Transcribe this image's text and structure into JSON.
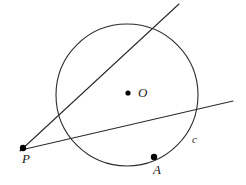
{
  "figure": {
    "background_color": "#ffffff",
    "stroke_color": "#2b2b2b",
    "point_color": "#000000",
    "stroke_width": 1.1,
    "width": 246,
    "height": 185
  },
  "labels": {
    "point_p": "P",
    "point_a": "A",
    "center_o": "O",
    "circle_c": "c"
  },
  "geometry": {
    "circle": {
      "cx": 127,
      "cy": 95,
      "r": 71
    },
    "center_dot": {
      "cx": 128,
      "cy": 93,
      "r": 2.6
    },
    "point_p": {
      "cx": 23,
      "cy": 148,
      "r": 3.2
    },
    "point_a": {
      "cx": 154,
      "cy": 157,
      "r": 3.2
    },
    "secant_line": {
      "x1": 20,
      "y1": 151,
      "x2": 179,
      "y2": 4
    },
    "chord_line": {
      "x1": 21,
      "y1": 150,
      "x2": 233,
      "y2": 101
    }
  }
}
